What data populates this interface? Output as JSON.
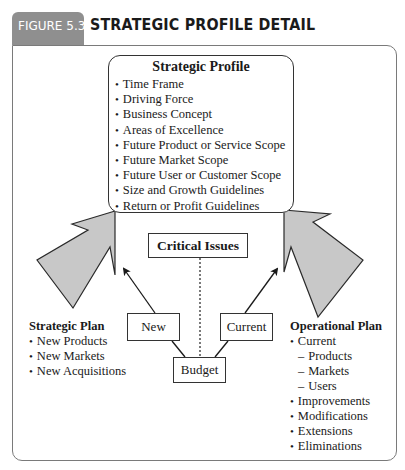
{
  "figure": {
    "number_label": "FIGURE 5.3",
    "title": "STRATEGIC PROFILE DETAIL"
  },
  "strategic_profile": {
    "title": "Strategic Profile",
    "items": [
      "Time Frame",
      "Driving Force",
      "Business Concept",
      "Areas of Excellence",
      "Future Product or Service Scope",
      "Future Market Scope",
      "Future User or Customer Scope",
      "Size and Growth Guidelines",
      "Return or Profit Guidelines"
    ]
  },
  "center": {
    "critical_issues": "Critical Issues",
    "new": "New",
    "current": "Current",
    "budget": "Budget"
  },
  "strategic_plan": {
    "title": "Strategic Plan",
    "items": [
      "New Products",
      "New Markets",
      "New Acquisitions"
    ]
  },
  "operational_plan": {
    "title": "Operational Plan",
    "items": [
      {
        "type": "bullet",
        "text": "Current"
      },
      {
        "type": "sub",
        "text": "Products"
      },
      {
        "type": "sub",
        "text": "Markets"
      },
      {
        "type": "sub",
        "text": "Users"
      },
      {
        "type": "bullet",
        "text": "Improvements"
      },
      {
        "type": "bullet",
        "text": "Modifications"
      },
      {
        "type": "bullet",
        "text": "Extensions"
      },
      {
        "type": "bullet",
        "text": "Eliminations"
      }
    ]
  },
  "colors": {
    "tab": "#8f8f8f",
    "arrow_fill": "#c8c8c8",
    "frame": "#7a7a7a",
    "text": "#1a1a1a"
  }
}
